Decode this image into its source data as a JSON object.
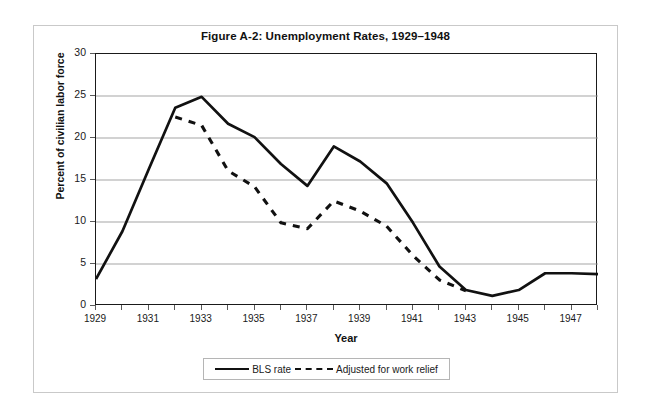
{
  "chart_data": {
    "type": "line",
    "title": "Figure A-2: Unemployment Rates, 1929–1948",
    "xlabel": "Year",
    "ylabel": "Percent of civilian labor force",
    "xlim": [
      1929,
      1948
    ],
    "ylim": [
      0,
      30
    ],
    "ytick_labels": [
      "0",
      "5",
      "10",
      "15",
      "20",
      "25",
      "30"
    ],
    "ytick_values": [
      0,
      5,
      10,
      15,
      20,
      25,
      30
    ],
    "xtick_labels": [
      "1929",
      "1931",
      "1933",
      "1935",
      "1937",
      "1939",
      "1941",
      "1943",
      "1945",
      "1947"
    ],
    "xtick_values": [
      1929,
      1931,
      1933,
      1935,
      1937,
      1939,
      1941,
      1943,
      1945,
      1947
    ],
    "x": [
      1929,
      1930,
      1931,
      1932,
      1933,
      1934,
      1935,
      1936,
      1937,
      1938,
      1939,
      1940,
      1941,
      1942,
      1943,
      1944,
      1945,
      1946,
      1947,
      1948
    ],
    "grid": "horizontal",
    "legend_position": "bottom",
    "series": [
      {
        "name": "BLS rate",
        "style": "solid",
        "color": "#111111",
        "x": [
          1929,
          1930,
          1931,
          1932,
          1933,
          1934,
          1935,
          1936,
          1937,
          1938,
          1939,
          1940,
          1941,
          1942,
          1943,
          1944,
          1945,
          1946,
          1947,
          1948
        ],
        "values": [
          3.2,
          8.9,
          16.3,
          23.6,
          24.9,
          21.7,
          20.1,
          16.9,
          14.3,
          19.0,
          17.2,
          14.6,
          9.9,
          4.7,
          1.9,
          1.2,
          1.9,
          3.9,
          3.9,
          3.8
        ]
      },
      {
        "name": "Adjusted for work relief",
        "style": "dashed",
        "color": "#111111",
        "x": [
          1932,
          1933,
          1934,
          1935,
          1936,
          1937,
          1938,
          1939,
          1940,
          1941,
          1942,
          1943
        ],
        "values": [
          22.5,
          21.5,
          16.1,
          14.2,
          9.9,
          9.2,
          12.5,
          11.3,
          9.5,
          6.0,
          3.1,
          1.8
        ]
      }
    ]
  },
  "legend": {
    "entries": [
      {
        "label": "BLS rate",
        "style": "solid"
      },
      {
        "label": "Adjusted for work relief",
        "style": "dashed"
      }
    ]
  }
}
